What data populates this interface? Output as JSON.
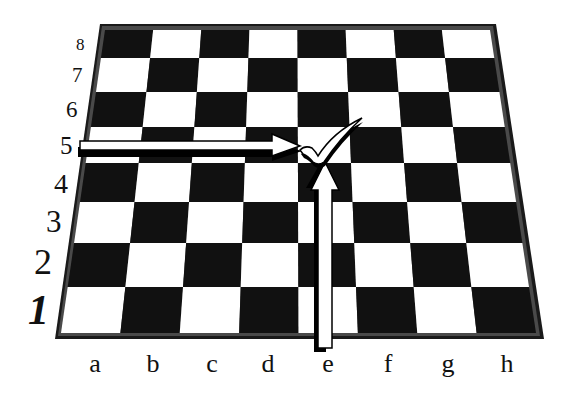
{
  "diagram": {
    "type": "chessboard-coordinates",
    "ranks": [
      "1",
      "2",
      "3",
      "4",
      "5",
      "6",
      "7",
      "8"
    ],
    "files": [
      "a",
      "b",
      "c",
      "d",
      "e",
      "f",
      "g",
      "h"
    ],
    "highlighted_square": "e5",
    "marker": "checkmark",
    "arrows": [
      {
        "from": "rank-5-label",
        "to": "e5",
        "direction": "right"
      },
      {
        "from": "file-e-label",
        "to": "e5",
        "direction": "up"
      }
    ],
    "colors": {
      "dark_square": "#111111",
      "light_square": "#ffffff",
      "frame": "#222222",
      "frame_inner": "#555555",
      "background": "#ffffff"
    }
  }
}
